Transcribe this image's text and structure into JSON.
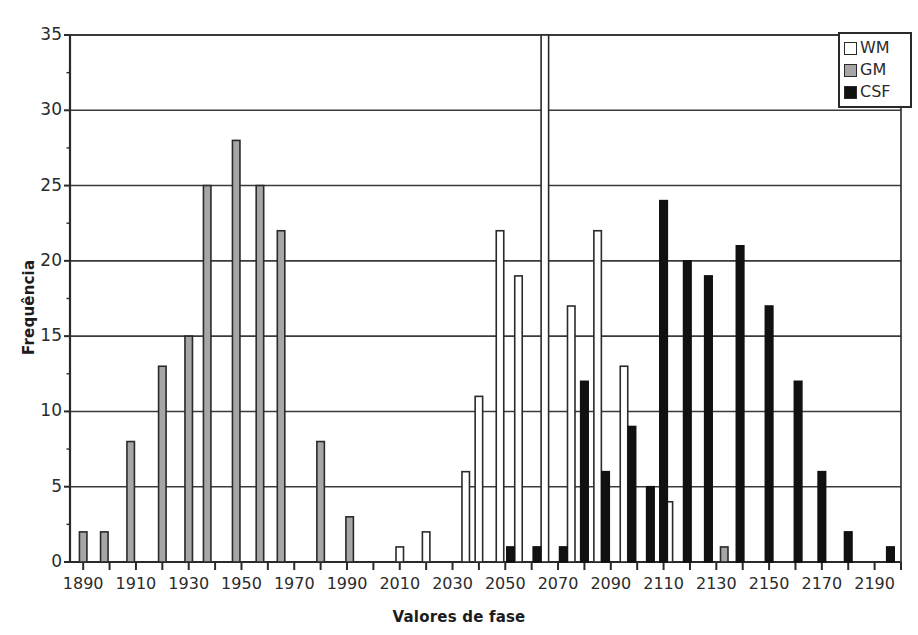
{
  "chart_data": {
    "type": "bar",
    "title": "",
    "xlabel": "Valores de fase",
    "ylabel": "Frequência",
    "xlim": [
      1885,
      2200
    ],
    "ylim": [
      0,
      35
    ],
    "ytick_labels": [
      "0",
      "5",
      "10",
      "15",
      "20",
      "25",
      "30",
      "35"
    ],
    "ytick_values": [
      0,
      5,
      10,
      15,
      20,
      25,
      30,
      35
    ],
    "xtick_labels": [
      "1890",
      "1910",
      "1930",
      "1950",
      "1970",
      "1990",
      "2010",
      "2030",
      "2050",
      "2070",
      "2090",
      "2110",
      "2130",
      "2150",
      "2170",
      "2190"
    ],
    "xtick_values": [
      1890,
      1910,
      1930,
      1950,
      1970,
      1990,
      2010,
      2030,
      2050,
      2070,
      2090,
      2110,
      2130,
      2150,
      2170,
      2190
    ],
    "minor_tick_values": [
      1900,
      1920,
      1940,
      1960,
      1980,
      2000,
      2020,
      2040,
      2060,
      2080,
      2100,
      2120,
      2140,
      2160,
      2180,
      2200
    ],
    "grid": "horizontal",
    "legend_position": "top-right",
    "series": [
      {
        "name": "WM",
        "color": "#ffffff",
        "edge_color": "#2a2a2a",
        "points": [
          {
            "x": 2010,
            "y": 1
          },
          {
            "x": 2020,
            "y": 2
          },
          {
            "x": 2035,
            "y": 6
          },
          {
            "x": 2040,
            "y": 11
          },
          {
            "x": 2048,
            "y": 22
          },
          {
            "x": 2055,
            "y": 19
          },
          {
            "x": 2065,
            "y": 35
          },
          {
            "x": 2075,
            "y": 17
          },
          {
            "x": 2085,
            "y": 22
          },
          {
            "x": 2095,
            "y": 13
          },
          {
            "x": 2112,
            "y": 4
          }
        ]
      },
      {
        "name": "GM",
        "color": "#a6a6a6",
        "edge_color": "#2a2a2a",
        "points": [
          {
            "x": 1890,
            "y": 2
          },
          {
            "x": 1898,
            "y": 2
          },
          {
            "x": 1908,
            "y": 8
          },
          {
            "x": 1920,
            "y": 13
          },
          {
            "x": 1930,
            "y": 15
          },
          {
            "x": 1937,
            "y": 25
          },
          {
            "x": 1948,
            "y": 28
          },
          {
            "x": 1957,
            "y": 25
          },
          {
            "x": 1965,
            "y": 22
          },
          {
            "x": 1980,
            "y": 8
          },
          {
            "x": 1991,
            "y": 3
          },
          {
            "x": 2133,
            "y": 1
          }
        ]
      },
      {
        "name": "CSF",
        "color": "#111111",
        "edge_color": "#111111",
        "points": [
          {
            "x": 2052,
            "y": 1
          },
          {
            "x": 2062,
            "y": 1
          },
          {
            "x": 2072,
            "y": 1
          },
          {
            "x": 2080,
            "y": 12
          },
          {
            "x": 2088,
            "y": 6
          },
          {
            "x": 2098,
            "y": 9
          },
          {
            "x": 2105,
            "y": 5
          },
          {
            "x": 2110,
            "y": 24
          },
          {
            "x": 2119,
            "y": 20
          },
          {
            "x": 2127,
            "y": 19
          },
          {
            "x": 2139,
            "y": 21
          },
          {
            "x": 2150,
            "y": 17
          },
          {
            "x": 2161,
            "y": 12
          },
          {
            "x": 2170,
            "y": 6
          },
          {
            "x": 2180,
            "y": 2
          },
          {
            "x": 2196,
            "y": 1
          }
        ]
      }
    ]
  },
  "legend": {
    "items": [
      {
        "label": "WM",
        "color": "#ffffff"
      },
      {
        "label": "GM",
        "color": "#a6a6a6"
      },
      {
        "label": "CSF",
        "color": "#111111"
      }
    ]
  }
}
